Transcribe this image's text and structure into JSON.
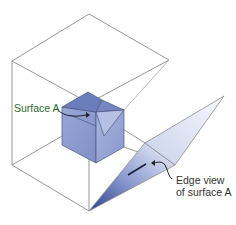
{
  "diagram": {
    "type": "3d-projection-illustration",
    "labels": {
      "surface_a": "Surface A",
      "edge_view_line1": "Edge view",
      "edge_view_line2": "of surface A"
    },
    "colors": {
      "frame_lines": "#8a8a8a",
      "cube_fill": "#8e9fd0",
      "cube_dark": "#5d6fb0",
      "cube_edges": "#4a5680",
      "panel_light": "#e8ecf7",
      "panel_dark": "#3b4d99",
      "label_surface": "#2d6a2d",
      "label_text": "#333333",
      "leader": "#222222"
    }
  }
}
